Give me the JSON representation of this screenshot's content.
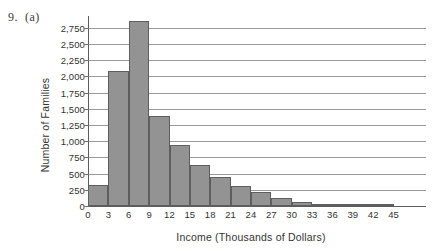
{
  "problem": {
    "number": "9.",
    "part": "(a)"
  },
  "chart_data": {
    "type": "bar",
    "title": "",
    "subtitle": "",
    "xlabel": "Income (Thousands of Dollars)",
    "ylabel": "Number of Families",
    "categories": [
      "0-3",
      "3-6",
      "6-9",
      "9-12",
      "12-15",
      "15-18",
      "18-21",
      "21-24",
      "24-27",
      "27-30",
      "30-33",
      "33-36",
      "36-39",
      "39-42",
      "42-45"
    ],
    "bin_edges": [
      0,
      3,
      6,
      9,
      12,
      15,
      18,
      21,
      24,
      27,
      30,
      33,
      36,
      39,
      42,
      45
    ],
    "values": [
      330,
      2080,
      2850,
      1390,
      940,
      630,
      450,
      310,
      220,
      120,
      55,
      30,
      28,
      25,
      25
    ],
    "x_tick_labels": [
      "0",
      "3",
      "6",
      "9",
      "12",
      "15",
      "18",
      "21",
      "24",
      "27",
      "30",
      "33",
      "36",
      "39",
      "42",
      "45"
    ],
    "y_tick_labels": [
      "0",
      "250",
      "500",
      "750",
      "1,000",
      "1,250",
      "1,500",
      "1,750",
      "2,000",
      "2,250",
      "2,500",
      "2,750"
    ],
    "y_tick_values": [
      0,
      250,
      500,
      750,
      1000,
      1250,
      1500,
      1750,
      2000,
      2250,
      2500,
      2750
    ],
    "ylim": [
      0,
      2900
    ],
    "xlim": [
      0,
      48
    ],
    "grid": true,
    "legend": false,
    "bar_fill_color": "#939393",
    "bar_border_color": "#5e5e5e",
    "gridline_color": "#9a9a9a",
    "axis_color": "#5c5c5c",
    "background_color": "#ffffff"
  }
}
